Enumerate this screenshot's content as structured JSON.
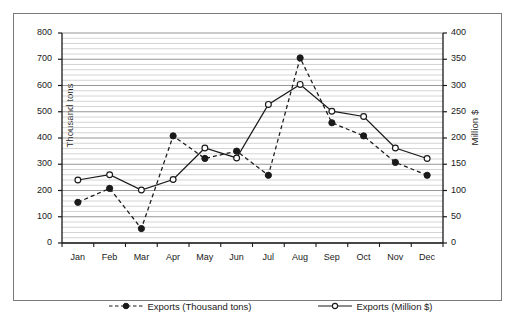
{
  "chart_data": {
    "type": "line",
    "title": "",
    "categories": [
      "Jan",
      "Feb",
      "Mar",
      "Apr",
      "May",
      "Jun",
      "Jul",
      "Aug",
      "Sep",
      "Oct",
      "Nov",
      "Dec"
    ],
    "series": [
      {
        "name": "Exports (Thousand tons)",
        "axis": "left",
        "marker": "filled-circle",
        "line_style": "dashed",
        "color": "#1a1a1a",
        "values": [
          155,
          208,
          55,
          408,
          322,
          350,
          258,
          705,
          458,
          408,
          307,
          258
        ]
      },
      {
        "name": "Exports (Million $)",
        "axis": "right",
        "marker": "open-circle",
        "line_style": "solid",
        "color": "#1a1a1a",
        "values": [
          120,
          130,
          101,
          121,
          181,
          162,
          264,
          302,
          251,
          241,
          181,
          161
        ]
      }
    ],
    "left_axis": {
      "label": "Thousand tons",
      "ticks": [
        "0",
        "100",
        "200",
        "300",
        "400",
        "500",
        "600",
        "700",
        "800"
      ],
      "ylim": [
        0,
        800
      ],
      "major_step": 100,
      "minor_step": 20
    },
    "right_axis": {
      "label": "Million $",
      "ticks": [
        "0",
        "50",
        "100",
        "150",
        "200",
        "250",
        "300",
        "350",
        "400"
      ],
      "ylim": [
        0,
        400
      ],
      "major_step": 50
    },
    "xlabel": "",
    "grid": "horizontal-major-and-minor",
    "legend_position": "bottom"
  },
  "legend": {
    "entries": [
      {
        "label": "Exports (Thousand tons)"
      },
      {
        "label": "Exports (Million $)"
      }
    ]
  }
}
